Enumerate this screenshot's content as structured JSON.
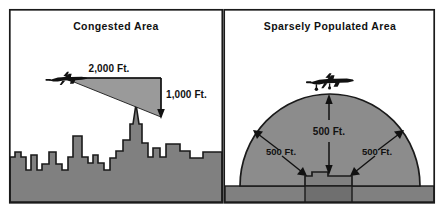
{
  "figure": {
    "name": "minimum-safe-altitudes-diagram",
    "width": 444,
    "height": 212,
    "background_color": "#ffffff",
    "border_color": "#1a1a1a",
    "divider_color": "#1a1a1a"
  },
  "colors": {
    "ink": "#111111",
    "fill_gray": "#808080",
    "wedge_gray": "#9a9a9a",
    "dome_gray": "#8c8c8c",
    "outline": "#1a1a1a",
    "paper": "#ffffff"
  },
  "panels": [
    {
      "id": "congested",
      "title": "Congested Area",
      "icons": {
        "aircraft": "airplane-icon",
        "terrain": "city-skyline-icon"
      },
      "labels": [
        {
          "id": "horizontal-clearance",
          "text": "2,000 Ft.",
          "icon": "arrow-left-icon",
          "meaning": "horizontal distance from aircraft to tallest obstacle"
        },
        {
          "id": "vertical-clearance",
          "text": "1,000 Ft.",
          "icon": "arrow-down-icon",
          "meaning": "vertical clearance above tallest obstacle"
        }
      ]
    },
    {
      "id": "sparsely-populated",
      "title": "Sparsely Populated Area",
      "icons": {
        "aircraft": "airplane-icon",
        "terrain": "building-icon",
        "clearance_zone": "dome-icon"
      },
      "labels": [
        {
          "id": "vertical-clearance",
          "text": "500 Ft.",
          "icon": "arrow-down-icon",
          "meaning": "vertical clearance above structure"
        },
        {
          "id": "left-clearance",
          "text": "500 Ft.",
          "icon": "arrow-double-diagonal-icon",
          "meaning": "lateral clearance to the left of structure"
        },
        {
          "id": "right-clearance",
          "text": "500 Ft.",
          "icon": "arrow-double-diagonal-icon",
          "meaning": "lateral clearance to the right of structure"
        }
      ]
    }
  ]
}
